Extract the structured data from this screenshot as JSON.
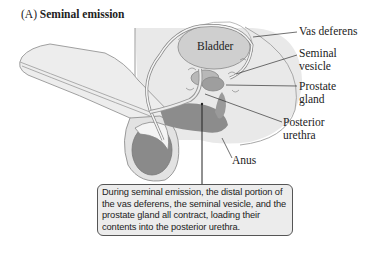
{
  "figure": {
    "panel_letter": "(A)",
    "title": "Seminal emission"
  },
  "labels": {
    "bladder": "Bladder",
    "vas_deferens": "Vas deferens",
    "seminal_vesicle_1": "Seminal",
    "seminal_vesicle_2": "vesicle",
    "prostate_1": "Prostate",
    "prostate_2": "gland",
    "posterior_urethra_1": "Posterior",
    "posterior_urethra_2": "urethra",
    "anus": "Anus"
  },
  "callout": {
    "text": "During seminal emission, the distal portion of the vas deferens, the seminal vesicle, and the prostate gland all contract, loading their contents into the posterior urethra."
  },
  "colors": {
    "tissue_light": "#e6e6e6",
    "tissue_mid": "#d2d2d2",
    "tissue_dark": "#8a8a8a",
    "outline": "#9a9a9a",
    "callout_bg": "#ececec"
  }
}
